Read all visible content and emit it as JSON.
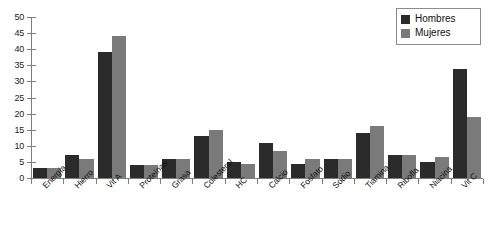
{
  "chart_data": {
    "type": "bar",
    "title": "",
    "xlabel": "",
    "ylabel": "",
    "ylim": [
      0,
      50
    ],
    "yticks": [
      0,
      5,
      10,
      15,
      20,
      25,
      30,
      35,
      40,
      45,
      50
    ],
    "grid": false,
    "legend_position": "top-right",
    "categories": [
      "Energía",
      "Hierro",
      "Vit A",
      "Proteínas",
      "Grasa",
      "Colesterol",
      "HC",
      "Calcio",
      "Fosfato",
      "Sodio",
      "Tiamina",
      "Ribofla",
      "Niacina",
      "Vit C"
    ],
    "series": [
      {
        "name": "Hombres",
        "color": "#2b2b2b",
        "values": [
          3,
          7,
          39,
          4,
          6,
          13,
          5,
          11,
          4.5,
          6,
          14,
          7,
          5,
          34
        ]
      },
      {
        "name": "Mujeres",
        "color": "#7a7a7a",
        "values": [
          3,
          6,
          44,
          4,
          6,
          15,
          4.5,
          8.5,
          6,
          6,
          16,
          7,
          6.5,
          19
        ]
      }
    ]
  },
  "legend": {
    "items": [
      {
        "label": "Hombres",
        "color": "#2b2b2b"
      },
      {
        "label": "Mujeres",
        "color": "#7a7a7a"
      }
    ]
  },
  "colors": {
    "axis": "#7d7d7d",
    "text": "#111111",
    "background": "#ffffff"
  }
}
